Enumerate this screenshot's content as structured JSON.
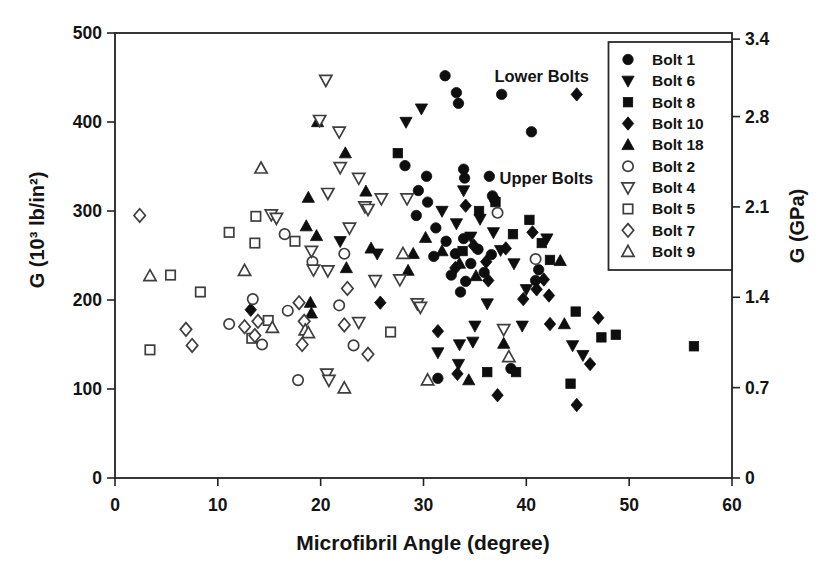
{
  "figure": {
    "background": "#ffffff"
  },
  "chart_data": {
    "type": "scatter",
    "title": "",
    "x_axis": {
      "label": "Microfibril Angle (degree)",
      "min": 0,
      "max": 60,
      "ticks": [
        0,
        10,
        20,
        30,
        40,
        50,
        60
      ]
    },
    "y_axis_left": {
      "label": "G (10³ lb/in²)",
      "min": 0,
      "max": 500,
      "ticks": [
        0,
        100,
        200,
        300,
        400,
        500
      ]
    },
    "y_axis_right": {
      "label": "G (GPa)",
      "ticks": [
        0,
        0.7,
        1.4,
        2.1,
        2.8,
        3.4
      ],
      "ksi_per_gpa": 145.038
    },
    "grid": "off",
    "legend_position": "top-right-inside",
    "annotations": [
      {
        "text": "Lower Bolts",
        "x": 36.9,
        "y": 452
      },
      {
        "text": "Upper Bolts",
        "x": 37.4,
        "y": 337
      }
    ],
    "colors": {
      "marker_filled": "#0e0e0e",
      "marker_open_stroke": "#3e3e3e",
      "axis": "#222222"
    },
    "series": [
      {
        "name": "Bolt 1",
        "marker": "circle",
        "fill": "filled",
        "points": [
          [
            32.1,
            452
          ],
          [
            33.2,
            433
          ],
          [
            33.4,
            421
          ],
          [
            37.6,
            431
          ],
          [
            40.5,
            389
          ],
          [
            28.2,
            351
          ],
          [
            30.3,
            339
          ],
          [
            33.9,
            347
          ],
          [
            34.0,
            337
          ],
          [
            36.4,
            339
          ],
          [
            29.5,
            323
          ],
          [
            30.4,
            310
          ],
          [
            29.3,
            295
          ],
          [
            36.7,
            317
          ],
          [
            36.9,
            313
          ],
          [
            31.2,
            281
          ],
          [
            32.2,
            266
          ],
          [
            33.1,
            252
          ],
          [
            33.9,
            269
          ],
          [
            34.6,
            241
          ],
          [
            35.3,
            257
          ],
          [
            32.7,
            228
          ],
          [
            34.1,
            221
          ],
          [
            35.9,
            231
          ],
          [
            36.6,
            251
          ],
          [
            31.0,
            249
          ],
          [
            33.6,
            209
          ],
          [
            41.2,
            234
          ],
          [
            40.9,
            222
          ],
          [
            31.4,
            112
          ],
          [
            38.5,
            123
          ]
        ]
      },
      {
        "name": "Bolt 6",
        "marker": "triangle-down",
        "fill": "filled",
        "points": [
          [
            29.8,
            415
          ],
          [
            28.3,
            400
          ],
          [
            25.5,
            252
          ],
          [
            21.9,
            266
          ],
          [
            33.9,
            323
          ],
          [
            31.8,
            300
          ],
          [
            33.2,
            286
          ],
          [
            34.6,
            271
          ],
          [
            35.5,
            291
          ],
          [
            36.8,
            276
          ],
          [
            37.5,
            256
          ],
          [
            38.8,
            241
          ],
          [
            35.0,
            171
          ],
          [
            36.2,
            196
          ],
          [
            40.0,
            212
          ],
          [
            42.0,
            269
          ],
          [
            39.6,
            171
          ],
          [
            33.5,
            150
          ],
          [
            34.8,
            153
          ],
          [
            31.4,
            141
          ],
          [
            33.4,
            128
          ],
          [
            44.5,
            149
          ],
          [
            45.5,
            138
          ]
        ]
      },
      {
        "name": "Bolt 8",
        "marker": "square",
        "fill": "filled",
        "points": [
          [
            27.5,
            365
          ],
          [
            33.8,
            255
          ],
          [
            35.4,
            300
          ],
          [
            37.0,
            310
          ],
          [
            38.7,
            274
          ],
          [
            40.3,
            290
          ],
          [
            41.5,
            264
          ],
          [
            42.3,
            245
          ],
          [
            44.8,
            187
          ],
          [
            47.3,
            158
          ],
          [
            48.7,
            161
          ],
          [
            56.3,
            148
          ],
          [
            44.3,
            106
          ],
          [
            36.2,
            119
          ],
          [
            39.0,
            119
          ]
        ]
      },
      {
        "name": "Bolt 10",
        "marker": "diamond",
        "fill": "filled",
        "points": [
          [
            13.2,
            189
          ],
          [
            25.8,
            197
          ],
          [
            44.9,
            431
          ],
          [
            34.1,
            306
          ],
          [
            31.4,
            165
          ],
          [
            33.3,
            117
          ],
          [
            37.2,
            93
          ],
          [
            33.1,
            236
          ],
          [
            34.9,
            261
          ],
          [
            36.1,
            243
          ],
          [
            38.0,
            258
          ],
          [
            36.3,
            222
          ],
          [
            40.6,
            276
          ],
          [
            39.7,
            201
          ],
          [
            41.0,
            212
          ],
          [
            41.7,
            223
          ],
          [
            42.2,
            205
          ],
          [
            42.3,
            173
          ],
          [
            46.2,
            128
          ],
          [
            47.0,
            180
          ],
          [
            44.9,
            82
          ]
        ]
      },
      {
        "name": "Bolt 18",
        "marker": "triangle-up",
        "fill": "filled",
        "points": [
          [
            19.7,
            400
          ],
          [
            22.4,
            365
          ],
          [
            18.8,
            315
          ],
          [
            24.4,
            322
          ],
          [
            18.6,
            283
          ],
          [
            19.6,
            272
          ],
          [
            22.5,
            236
          ],
          [
            24.9,
            258
          ],
          [
            28.5,
            233
          ],
          [
            29.0,
            252
          ],
          [
            19.0,
            197
          ],
          [
            19.1,
            185
          ],
          [
            30.2,
            270
          ],
          [
            31.8,
            255
          ],
          [
            33.5,
            241
          ],
          [
            35.1,
            227
          ],
          [
            34.4,
            110
          ],
          [
            37.8,
            151
          ],
          [
            43.3,
            244
          ],
          [
            43.7,
            173
          ]
        ]
      },
      {
        "name": "Bolt 2",
        "marker": "circle",
        "fill": "open",
        "points": [
          [
            11.1,
            173
          ],
          [
            13.4,
            201
          ],
          [
            14.3,
            150
          ],
          [
            16.5,
            274
          ],
          [
            16.8,
            188
          ],
          [
            17.8,
            110
          ],
          [
            19.2,
            243
          ],
          [
            21.8,
            194
          ],
          [
            22.3,
            252
          ],
          [
            23.2,
            149
          ],
          [
            37.2,
            298
          ],
          [
            40.9,
            246
          ]
        ]
      },
      {
        "name": "Bolt 4",
        "marker": "triangle-down",
        "fill": "open",
        "points": [
          [
            20.5,
            447
          ],
          [
            19.9,
            402
          ],
          [
            21.8,
            389
          ],
          [
            21.9,
            349
          ],
          [
            23.7,
            337
          ],
          [
            20.7,
            320
          ],
          [
            24.3,
            305
          ],
          [
            24.6,
            302
          ],
          [
            25.9,
            314
          ],
          [
            28.4,
            314
          ],
          [
            15.2,
            296
          ],
          [
            15.7,
            292
          ],
          [
            19.1,
            255
          ],
          [
            19.3,
            234
          ],
          [
            20.7,
            233
          ],
          [
            22.8,
            281
          ],
          [
            25.3,
            222
          ],
          [
            27.7,
            223
          ],
          [
            23.7,
            175
          ],
          [
            20.6,
            117
          ],
          [
            20.8,
            110
          ],
          [
            29.4,
            196
          ],
          [
            29.7,
            192
          ],
          [
            37.8,
            167
          ]
        ]
      },
      {
        "name": "Bolt 5",
        "marker": "square",
        "fill": "open",
        "points": [
          [
            3.4,
            144
          ],
          [
            5.4,
            228
          ],
          [
            8.3,
            209
          ],
          [
            11.1,
            276
          ],
          [
            13.7,
            294
          ],
          [
            13.6,
            264
          ],
          [
            13.3,
            157
          ],
          [
            14.9,
            177
          ],
          [
            17.5,
            266
          ],
          [
            26.8,
            164
          ]
        ]
      },
      {
        "name": "Bolt 7",
        "marker": "diamond",
        "fill": "open",
        "points": [
          [
            2.4,
            295
          ],
          [
            6.9,
            167
          ],
          [
            7.5,
            149
          ],
          [
            12.6,
            170
          ],
          [
            13.9,
            176
          ],
          [
            13.6,
            160
          ],
          [
            17.9,
            197
          ],
          [
            18.4,
            176
          ],
          [
            18.2,
            150
          ],
          [
            22.6,
            213
          ],
          [
            22.3,
            172
          ],
          [
            24.6,
            139
          ]
        ]
      },
      {
        "name": "Bolt 9",
        "marker": "triangle-up",
        "fill": "open",
        "points": [
          [
            3.4,
            227
          ],
          [
            12.6,
            233
          ],
          [
            14.2,
            348
          ],
          [
            15.3,
            169
          ],
          [
            18.5,
            166
          ],
          [
            18.8,
            163
          ],
          [
            22.3,
            101
          ],
          [
            28.0,
            252
          ],
          [
            30.4,
            110
          ],
          [
            38.3,
            136
          ]
        ]
      }
    ]
  }
}
